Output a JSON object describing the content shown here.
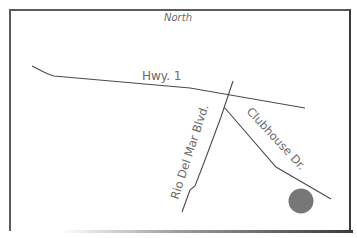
{
  "map": {
    "compass_label": "North",
    "roads": [
      {
        "name": "Hwy. 1"
      },
      {
        "name": "Rio Del Mar Blvd."
      },
      {
        "name": "Clubhouse Dr."
      }
    ],
    "marker": {
      "name": "destination-marker",
      "color": "#777777"
    }
  },
  "colors": {
    "road": "#4a4a4a",
    "label": "#6a6a6a",
    "border": "#4a4a4a"
  }
}
